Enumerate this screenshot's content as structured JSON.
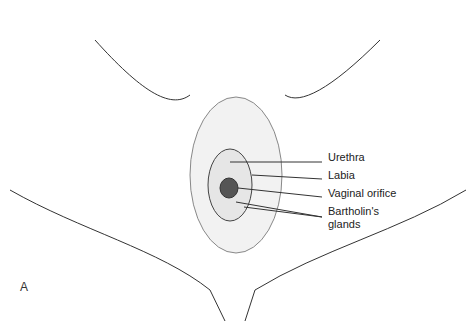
{
  "figure": {
    "panel_letter": "A",
    "labels": [
      {
        "text": "Urethra",
        "x": 328,
        "y": 157
      },
      {
        "text": "Labia",
        "x": 328,
        "y": 175
      },
      {
        "text": "Vaginal orifice",
        "x": 328,
        "y": 192
      },
      {
        "text": "Bartholin's",
        "x": 328,
        "y": 211
      },
      {
        "text": "glands",
        "x": 328,
        "y": 224
      }
    ]
  }
}
